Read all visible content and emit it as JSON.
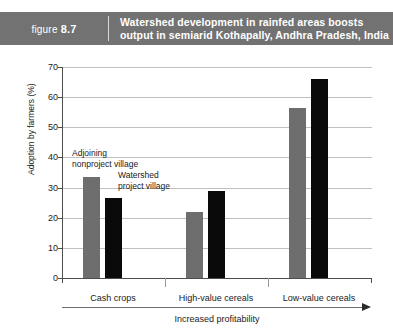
{
  "header": {
    "figure_prefix": "figure",
    "figure_number": "8.7",
    "title_line1": "Watershed development in rainfed areas boosts",
    "title_line2": "output in semiarid Kothapally, Andhra Pradesh, India",
    "background_color": "#727272",
    "text_color": "#ffffff"
  },
  "chart_data": {
    "type": "bar",
    "title": "Watershed development in rainfed areas boosts output in semiarid Kothapally, Andhra Pradesh, India",
    "categories": [
      "Cash crops",
      "High-value cereals",
      "Low-value cereals"
    ],
    "series": [
      {
        "name": "Adjoining nonproject village",
        "color": "#6e6e6e",
        "values": [
          33.5,
          22,
          56.5
        ]
      },
      {
        "name": "Watershed project village",
        "color": "#0a0a0a",
        "values": [
          26.5,
          29,
          66
        ]
      }
    ],
    "xlabel": "Increased profitability",
    "ylabel": "Adoption by farmers (%)",
    "ylim": [
      0,
      70
    ],
    "yticks": [
      0,
      10,
      20,
      30,
      40,
      50,
      60,
      70
    ],
    "ytick_labels": [
      "0",
      "10",
      "20",
      "30",
      "40",
      "50",
      "60",
      "70"
    ],
    "grid": true,
    "legend": "inline-annotations",
    "annotations": [
      {
        "text": "Adjoining\nnonproject village",
        "refers_to": "Adjoining nonproject village"
      },
      {
        "text": "Watershed\nproject village",
        "refers_to": "Watershed project village"
      }
    ]
  }
}
